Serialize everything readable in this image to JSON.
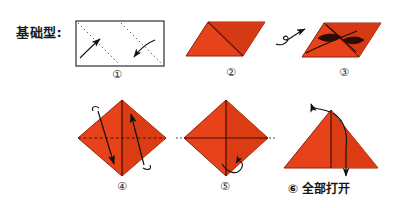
{
  "diagram": {
    "title_label": "基础型:",
    "background_color": "#ffffff",
    "paper_color": "#e8421a",
    "paper_shade_color": "#c9331040",
    "ink_color": "#1a1a1a",
    "steps": [
      {
        "number": "①",
        "shape": "rectangle",
        "description": "横长方形纸，画两条对角虚线折痕，两个弧形箭头指示折叠方向",
        "fold_lines": "dotted-diagonals",
        "arrows": 2
      },
      {
        "number": "②",
        "shape": "parallelogram",
        "description": "折成平行四边形，中间有一条竖向折痕",
        "fold_lines": "center-crease",
        "arrows": 0
      },
      {
        "number": "③",
        "shape": "parallelogram",
        "description": "平行四边形内有透镜状曲线箭头，指示向内压折",
        "fold_lines": "lens-curves",
        "arrows": 2
      },
      {
        "number": "④",
        "shape": "diamond",
        "description": "菱形，竖向实线折痕与横向虚线折痕，两个带钩直箭头",
        "fold_lines": "vertical-solid-horizontal-dashed",
        "arrows": 2
      },
      {
        "number": "⑤",
        "shape": "diamond",
        "description": "菱形，十字折痕，右下方小卷曲翻面箭头",
        "fold_lines": "cross-creases",
        "arrows": 1
      },
      {
        "number": "⑥",
        "caption": "全部打开",
        "shape": "triangle",
        "description": "三角形，中间一条竖线，上下各一个箭头",
        "fold_lines": "vertical-line",
        "arrows": 2
      }
    ],
    "transition_arrows": [
      {
        "between": "②→③",
        "type": "flip-over-curl"
      }
    ]
  }
}
